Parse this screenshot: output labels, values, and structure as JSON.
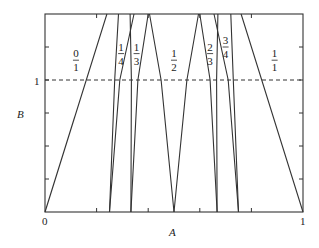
{
  "chart_data": {
    "type": "line",
    "title": "",
    "xlabel": "A",
    "ylabel": "B",
    "xlim": [
      0,
      1
    ],
    "ylim": [
      0,
      1.5
    ],
    "x_tick_labels": [
      "0",
      "1"
    ],
    "x_ticks": [
      0,
      0.2,
      0.4,
      0.6,
      0.8,
      1
    ],
    "y_tick_labels": [
      "1"
    ],
    "y_ticks": [
      0,
      0.25,
      0.5,
      0.75,
      1,
      1.25,
      1.5
    ],
    "grid": false,
    "legend": "none",
    "reference_line": {
      "y": 1,
      "style": "dashed"
    },
    "region_labels": [
      {
        "text_num": "0",
        "text_den": "1",
        "x": 0.12,
        "y": 1.15
      },
      {
        "text_num": "1",
        "text_den": "4",
        "x": 0.295,
        "y": 1.2
      },
      {
        "text_num": "1",
        "text_den": "3",
        "x": 0.355,
        "y": 1.2
      },
      {
        "text_num": "1",
        "text_den": "2",
        "x": 0.5,
        "y": 1.15
      },
      {
        "text_num": "2",
        "text_den": "3",
        "x": 0.64,
        "y": 1.2
      },
      {
        "text_num": "3",
        "text_den": "4",
        "x": 0.7,
        "y": 1.25
      },
      {
        "text_num": "1",
        "text_den": "1",
        "x": 0.89,
        "y": 1.15
      }
    ],
    "series": [
      {
        "name": "0/1 boundary",
        "points": [
          [
            0,
            0
          ],
          [
            0.24,
            1.5
          ]
        ]
      },
      {
        "name": "1/4 left",
        "points": [
          [
            0.25,
            0
          ],
          [
            0.27,
            1.0
          ],
          [
            0.285,
            1.5
          ]
        ]
      },
      {
        "name": "1/4 right",
        "points": [
          [
            0.25,
            0
          ],
          [
            0.29,
            1.0
          ],
          [
            0.345,
            1.5
          ]
        ]
      },
      {
        "name": "1/3 left",
        "points": [
          [
            0.333,
            0
          ],
          [
            0.335,
            1.0
          ],
          [
            0.33,
            1.5
          ]
        ]
      },
      {
        "name": "1/3 right",
        "points": [
          [
            0.333,
            0
          ],
          [
            0.36,
            1.0
          ],
          [
            0.4,
            1.5
          ]
        ]
      },
      {
        "name": "1/2 left",
        "points": [
          [
            0.5,
            0
          ],
          [
            0.45,
            1.0
          ],
          [
            0.405,
            1.5
          ]
        ]
      },
      {
        "name": "1/2 right",
        "points": [
          [
            0.5,
            0
          ],
          [
            0.55,
            1.0
          ],
          [
            0.595,
            1.5
          ]
        ]
      },
      {
        "name": "2/3 left",
        "points": [
          [
            0.667,
            0
          ],
          [
            0.64,
            1.0
          ],
          [
            0.6,
            1.5
          ]
        ]
      },
      {
        "name": "2/3 right",
        "points": [
          [
            0.667,
            0
          ],
          [
            0.665,
            1.0
          ],
          [
            0.67,
            1.5
          ]
        ]
      },
      {
        "name": "3/4 left",
        "points": [
          [
            0.75,
            0
          ],
          [
            0.71,
            1.0
          ],
          [
            0.655,
            1.5
          ]
        ]
      },
      {
        "name": "3/4 right",
        "points": [
          [
            0.75,
            0
          ],
          [
            0.73,
            1.0
          ],
          [
            0.72,
            1.5
          ]
        ]
      },
      {
        "name": "1/1 boundary",
        "points": [
          [
            1,
            0
          ],
          [
            0.76,
            1.5
          ]
        ]
      }
    ]
  },
  "axes": {
    "x_origin_label": "0",
    "x_end_label": "1",
    "y_one_label": "1",
    "x_title": "A",
    "y_title": "B"
  }
}
